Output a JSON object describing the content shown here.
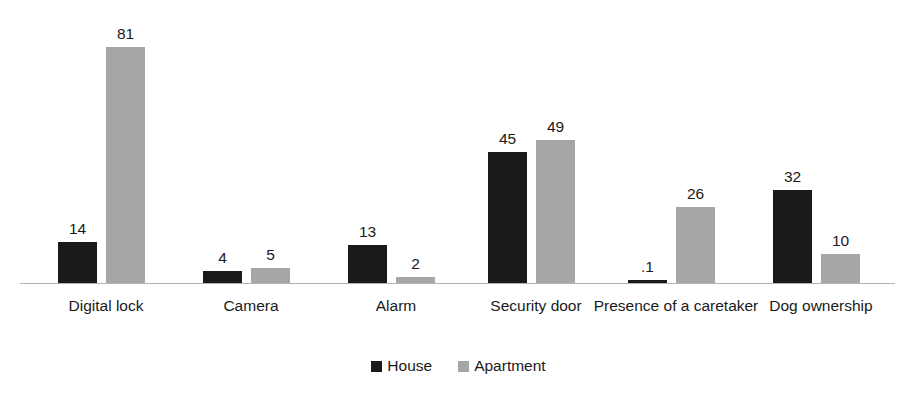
{
  "chart_data": {
    "type": "bar",
    "title": "",
    "subtitle": "",
    "xlabel": "",
    "ylabel": "",
    "ylim": [
      0,
      90
    ],
    "grid": false,
    "legend_position": "bottom-center",
    "orientation": "vertical",
    "grouping": "clustered",
    "categories": [
      "Digital lock",
      "Camera",
      "Alarm",
      "Security door",
      "Presence of a caretaker",
      "Dog ownership"
    ],
    "series": [
      {
        "name": "House",
        "color": "#1A1A1A",
        "values": [
          14,
          4,
          13,
          45,
          0.1,
          32
        ],
        "labels": [
          "14",
          "4",
          "13",
          "45",
          ".1",
          "32"
        ]
      },
      {
        "name": "Apartment",
        "color": "#A6A6A6",
        "values": [
          81,
          5,
          2,
          49,
          26,
          10
        ],
        "labels": [
          "81",
          "5",
          "2",
          "49",
          "26",
          "10"
        ]
      }
    ]
  },
  "legend": {
    "items": [
      {
        "label": "House",
        "swatch": "house-legend-swatch"
      },
      {
        "label": "Apartment",
        "swatch": "apartment-legend-swatch"
      }
    ]
  },
  "layout": {
    "axis_baseline_y": 283,
    "px_per_unit": 2.91,
    "bar_width": 39,
    "groups": [
      {
        "house_x": 58,
        "apartment_x": 106,
        "label_left": 20,
        "label_width": 172
      },
      {
        "house_x": 203,
        "apartment_x": 251,
        "label_left": 165,
        "label_width": 172
      },
      {
        "house_x": 348,
        "apartment_x": 396,
        "label_left": 310,
        "label_width": 172
      },
      {
        "house_x": 488,
        "apartment_x": 536,
        "label_left": 450,
        "label_width": 172
      },
      {
        "house_x": 628,
        "apartment_x": 676,
        "label_left": 590,
        "label_width": 172
      },
      {
        "house_x": 773,
        "apartment_x": 821,
        "label_left": 735,
        "label_width": 172
      }
    ]
  }
}
